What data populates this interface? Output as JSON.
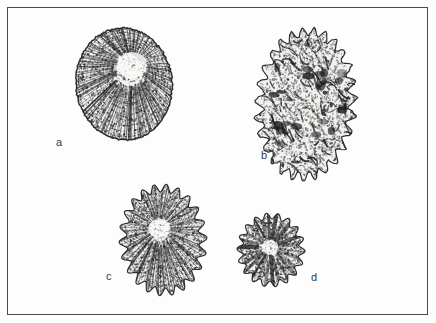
{
  "figure": {
    "kind": "scientific-specimen-plate",
    "caption_visible": false,
    "background_color": "#fdfdfc",
    "frame": {
      "border_color": "#4a4a4a",
      "border_width": 1,
      "x": 7,
      "y": 7,
      "width": 421,
      "height": 308
    },
    "ink_color": "#1a1a1a",
    "label_color": "#3a3a3a"
  },
  "specimens": [
    {
      "label": "a",
      "label_x": 56,
      "label_y": 137,
      "cx": 124,
      "cy": 84,
      "rx": 48,
      "ry": 56,
      "rotation": -6,
      "outline": "smooth-oval",
      "texture": "radial-striate",
      "nucleus_x": 134,
      "nucleus_y": 66,
      "nucleus_r": 15,
      "ray_count": 118,
      "stipple_count": 1500,
      "density": 0.72,
      "lobes": 0,
      "lobe_depth": 0
    },
    {
      "label": "b",
      "label_x": 261,
      "label_y": 150,
      "cx": 306,
      "cy": 104,
      "rx": 44,
      "ry": 70,
      "rotation": 4,
      "outline": "spiky",
      "texture": "mottled-rugose",
      "nucleus_x": 306,
      "nucleus_y": 104,
      "nucleus_r": 0,
      "ray_count": 0,
      "stipple_count": 2100,
      "density": 0.55,
      "lobes": 27,
      "lobe_depth": 6
    },
    {
      "label": "c",
      "label_x": 106,
      "label_y": 271,
      "cx": 163,
      "cy": 240,
      "rx": 40,
      "ry": 52,
      "rotation": -3,
      "outline": "scalloped",
      "texture": "radial-striate",
      "nucleus_x": 160,
      "nucleus_y": 228,
      "nucleus_r": 11,
      "ray_count": 96,
      "stipple_count": 1300,
      "density": 0.6,
      "lobes": 22,
      "lobe_depth": 4
    },
    {
      "label": "d",
      "label_x": 311,
      "label_y": 272,
      "cx": 271,
      "cy": 250,
      "rx": 31,
      "ry": 34,
      "rotation": 2,
      "outline": "scalloped",
      "texture": "radial-wedge",
      "nucleus_x": 270,
      "nucleus_y": 247,
      "nucleus_r": 8,
      "ray_count": 26,
      "stipple_count": 700,
      "density": 0.8,
      "lobes": 18,
      "lobe_depth": 3
    }
  ]
}
